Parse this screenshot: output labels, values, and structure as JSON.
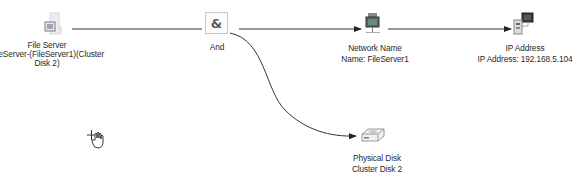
{
  "diagram": {
    "nodes": [
      {
        "id": "file-server",
        "icon": "file-server-icon",
        "title": "File Server",
        "lines": [
          "FileServer-(FileServer1)(Cluster",
          "Disk 2)"
        ]
      },
      {
        "id": "and",
        "icon": "and-gate-icon",
        "glyph": "&",
        "title": "And",
        "lines": []
      },
      {
        "id": "network-name",
        "icon": "network-name-icon",
        "title": "Network Name",
        "lines": [
          "Name: FileServer1"
        ]
      },
      {
        "id": "ip-address",
        "icon": "ip-address-icon",
        "title": "IP Address",
        "lines": [
          "IP Address: 192.168.5.104"
        ]
      },
      {
        "id": "physical-disk",
        "icon": "physical-disk-icon",
        "title": "Physical Disk",
        "lines": [
          "Cluster Disk 2"
        ]
      }
    ],
    "edges": [
      {
        "from": "file-server",
        "to": "and",
        "arrow": false
      },
      {
        "from": "and",
        "to": "network-name",
        "arrow": true
      },
      {
        "from": "network-name",
        "to": "ip-address",
        "arrow": true
      },
      {
        "from": "and",
        "to": "physical-disk",
        "arrow": true,
        "curved": true
      }
    ],
    "cursor": "hand-move-cursor"
  }
}
